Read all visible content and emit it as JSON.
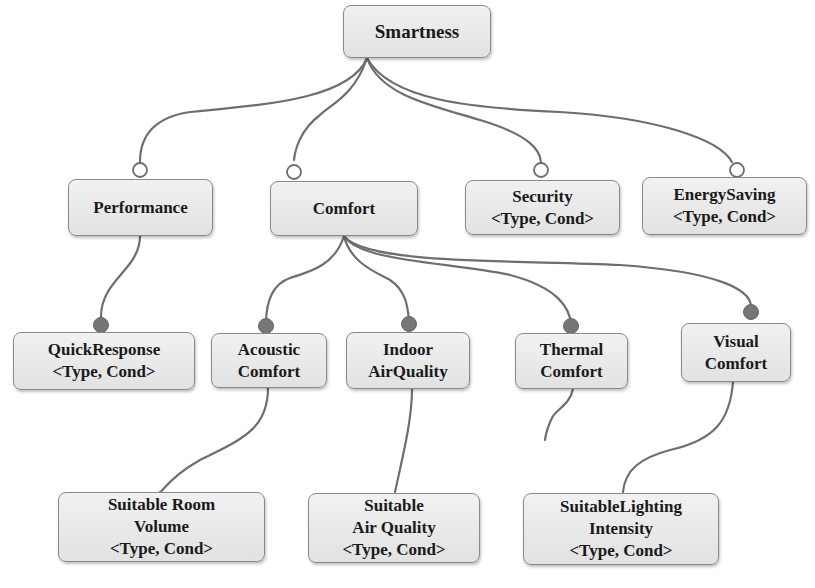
{
  "diagram": {
    "colors": {
      "edge": "#6e6e6e",
      "box_fill": "#e8e8e8",
      "box_border": "#8a8a8a",
      "mandatory_dot": "#707070",
      "optional_dot": "#ffffff"
    },
    "nodes": {
      "smartness": {
        "lines": [
          "Smartness"
        ]
      },
      "performance": {
        "lines": [
          "Performance"
        ]
      },
      "comfort": {
        "lines": [
          "Comfort"
        ]
      },
      "security": {
        "lines": [
          "Security",
          "<Type, Cond>"
        ]
      },
      "energy_saving": {
        "lines": [
          "EnergySaving",
          "<Type, Cond>"
        ]
      },
      "quick_response": {
        "lines": [
          "QuickResponse",
          "<Type, Cond>"
        ]
      },
      "acoustic_comfort": {
        "lines": [
          "Acoustic",
          "Comfort"
        ]
      },
      "indoor_air_quality": {
        "lines": [
          "Indoor",
          "AirQuality"
        ]
      },
      "thermal_comfort": {
        "lines": [
          "Thermal",
          "Comfort"
        ]
      },
      "visual_comfort": {
        "lines": [
          "Visual",
          "Comfort"
        ]
      },
      "suitable_room_volume": {
        "lines": [
          "Suitable Room",
          "Volume",
          "<Type, Cond>"
        ]
      },
      "suitable_air_quality": {
        "lines": [
          "Suitable",
          "Air Quality",
          "<Type, Cond>"
        ]
      },
      "suitable_lighting_intensity": {
        "lines": [
          "SuitableLighting",
          "Intensity",
          "<Type, Cond>"
        ]
      }
    },
    "edges": [
      {
        "from": "smartness",
        "to": "performance",
        "kind": "optional"
      },
      {
        "from": "smartness",
        "to": "comfort",
        "kind": "optional"
      },
      {
        "from": "smartness",
        "to": "security",
        "kind": "optional"
      },
      {
        "from": "smartness",
        "to": "energy_saving",
        "kind": "optional"
      },
      {
        "from": "performance",
        "to": "quick_response",
        "kind": "mandatory"
      },
      {
        "from": "comfort",
        "to": "acoustic_comfort",
        "kind": "mandatory"
      },
      {
        "from": "comfort",
        "to": "indoor_air_quality",
        "kind": "mandatory"
      },
      {
        "from": "comfort",
        "to": "thermal_comfort",
        "kind": "mandatory"
      },
      {
        "from": "comfort",
        "to": "visual_comfort",
        "kind": "mandatory"
      },
      {
        "from": "acoustic_comfort",
        "to": "suitable_room_volume",
        "kind": "plain"
      },
      {
        "from": "indoor_air_quality",
        "to": "suitable_air_quality",
        "kind": "plain"
      },
      {
        "from": "thermal_comfort",
        "to": "(truncated)",
        "kind": "plain"
      },
      {
        "from": "visual_comfort",
        "to": "suitable_lighting_intensity",
        "kind": "plain"
      }
    ]
  }
}
